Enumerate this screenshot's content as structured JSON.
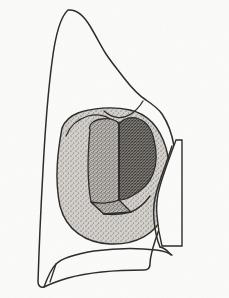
{
  "figure": {
    "domain": "diagram",
    "view": "proximal-occlusal line drawing",
    "caption": "",
    "technique": "pen and ink line drawing with stipple shading",
    "background_color": "#fbfbfa",
    "ink_color": "#2b2a28",
    "canvas": {
      "width": 229,
      "height": 298
    }
  },
  "regions": {
    "tooth_outline": {
      "name": "tooth crown and root outline",
      "stroke": "#2b2a28",
      "stroke_width": 1.5,
      "fill": "#fbfbfa",
      "description": "asymmetric crown silhouette with pointed cusp at upper left and broad rounded base"
    },
    "cavity_outer": {
      "name": "cavity preparation outer margin",
      "fill": "#c9c6c0",
      "stipple": "light",
      "stroke": "#2b2a28",
      "stroke_width": 1.4,
      "description": "rounded stippled preparation field occupying the central crown"
    },
    "facet_left": {
      "name": "axial wall left facet",
      "fill": "#a9a5a0",
      "stipple": "medium",
      "stroke": "#2b2a28",
      "stroke_width": 1.3,
      "description": "lighter shaded vertical wall left of the central dividing line"
    },
    "facet_right": {
      "name": "axial wall right facet",
      "fill": "#6e6a66",
      "stipple": "dense",
      "stroke": "#2b2a28",
      "stroke_width": 1.3,
      "description": "darker shaded wall right of the central dividing line"
    },
    "facet_floor": {
      "name": "pulpal floor facet",
      "fill": "#9e9a95",
      "stipple": "medium",
      "stroke": "#2b2a28",
      "stroke_width": 1.3,
      "description": "small angled trapezoidal floor at the base of the cavity"
    },
    "divider_line": {
      "name": "line angle divider",
      "stroke": "#2b2a28",
      "stroke_width": 1.6,
      "description": "vertical internal line angle separating the two axial wall facets"
    },
    "arch_line": {
      "name": "cavosurface arch line",
      "stroke": "#2b2a28",
      "stroke_width": 1.2,
      "description": "curved line arching over the top of the cavity interior"
    },
    "right_notch": {
      "name": "proximal notch",
      "fill": "#fbfbfa",
      "stroke": "#2b2a28",
      "stroke_width": 1.4,
      "description": "white wedge intruding from the right margin into the stippled field"
    },
    "cervical_line": {
      "name": "cervical junction line",
      "stroke": "#2b2a28",
      "stroke_width": 1.4,
      "description": "line sweeping from the lower left notch across to the right margin"
    }
  },
  "labels": {
    "annotations": []
  }
}
